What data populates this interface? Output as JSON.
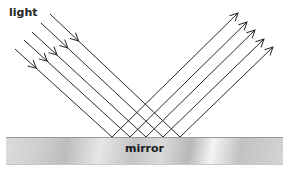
{
  "labels": {
    "light": "light",
    "mirror": "mirror"
  },
  "colors": {
    "ray": "#2a2a2a",
    "mirror_dark": "#b8b8b8",
    "mirror_light": "#f4f4f4"
  },
  "rays": [
    {
      "start": [
        15,
        49
      ],
      "hit": [
        112,
        137
      ],
      "end": [
        238,
        13
      ]
    },
    {
      "start": [
        24,
        40
      ],
      "hit": [
        130,
        137
      ],
      "end": [
        247,
        22
      ]
    },
    {
      "start": [
        32,
        32
      ],
      "hit": [
        146,
        137
      ],
      "end": [
        255,
        30
      ]
    },
    {
      "start": [
        41,
        23
      ],
      "hit": [
        163,
        137
      ],
      "end": [
        264,
        39
      ]
    },
    {
      "start": [
        50,
        14
      ],
      "hit": [
        180,
        137
      ],
      "end": [
        273,
        47
      ]
    }
  ]
}
